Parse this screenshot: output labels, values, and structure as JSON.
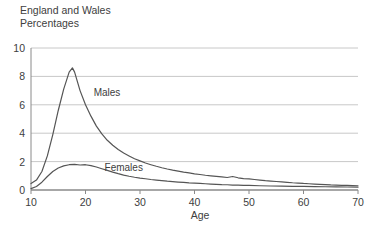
{
  "chart_data": {
    "type": "line",
    "title": "England and Wales",
    "subtitle": "Percentages",
    "xlabel": "Age",
    "ylabel": "",
    "xlim": [
      10,
      70
    ],
    "ylim": [
      0,
      10
    ],
    "xticks": [
      10,
      20,
      30,
      40,
      50,
      60,
      70
    ],
    "yticks": [
      0,
      2,
      4,
      6,
      8,
      10
    ],
    "grid": "horizontal",
    "legend_position": "inline-annotations",
    "annotations": [
      {
        "text": "Males",
        "x": 21.5,
        "y": 6.6
      },
      {
        "text": "Females",
        "x": 23.5,
        "y": 1.35
      }
    ],
    "series": [
      {
        "name": "Males",
        "color": "#555555",
        "x": [
          10,
          11,
          12,
          13,
          14,
          15,
          16,
          17,
          17.6,
          18,
          19,
          20,
          21,
          22,
          23,
          24,
          25,
          26,
          27,
          28,
          29,
          30,
          31,
          32,
          33,
          34,
          35,
          36,
          37,
          38,
          39,
          40,
          41,
          42,
          43,
          44,
          45,
          46,
          47,
          48,
          49,
          50,
          51,
          52,
          53,
          54,
          55,
          56,
          57,
          58,
          59,
          60,
          61,
          62,
          63,
          64,
          65,
          66,
          67,
          68,
          69,
          70
        ],
        "values": [
          0.45,
          0.7,
          1.3,
          2.4,
          3.9,
          5.6,
          7.1,
          8.3,
          8.6,
          8.3,
          7.0,
          6.0,
          5.2,
          4.5,
          3.95,
          3.5,
          3.15,
          2.85,
          2.6,
          2.4,
          2.2,
          2.05,
          1.9,
          1.78,
          1.67,
          1.57,
          1.48,
          1.4,
          1.33,
          1.26,
          1.2,
          1.14,
          1.09,
          1.04,
          1.0,
          0.96,
          0.92,
          0.88,
          0.95,
          0.86,
          0.8,
          0.78,
          0.74,
          0.7,
          0.66,
          0.63,
          0.6,
          0.57,
          0.54,
          0.51,
          0.49,
          0.46,
          0.44,
          0.42,
          0.4,
          0.38,
          0.36,
          0.35,
          0.33,
          0.32,
          0.31,
          0.3
        ]
      },
      {
        "name": "Females",
        "color": "#555555",
        "x": [
          10,
          11,
          12,
          13,
          14,
          15,
          16,
          17,
          18,
          19,
          20,
          21,
          22,
          23,
          24,
          25,
          26,
          27,
          28,
          29,
          30,
          31,
          32,
          33,
          34,
          35,
          36,
          37,
          38,
          39,
          40,
          41,
          42,
          43,
          44,
          45,
          46,
          47,
          48,
          49,
          50,
          52,
          54,
          56,
          58,
          60,
          62,
          64,
          66,
          68,
          70
        ],
        "values": [
          0.1,
          0.25,
          0.55,
          0.95,
          1.3,
          1.55,
          1.7,
          1.78,
          1.8,
          1.76,
          1.78,
          1.72,
          1.62,
          1.5,
          1.38,
          1.26,
          1.15,
          1.05,
          0.97,
          0.9,
          0.84,
          0.79,
          0.74,
          0.7,
          0.66,
          0.62,
          0.59,
          0.56,
          0.53,
          0.5,
          0.48,
          0.46,
          0.44,
          0.42,
          0.4,
          0.38,
          0.37,
          0.35,
          0.34,
          0.33,
          0.32,
          0.3,
          0.28,
          0.27,
          0.26,
          0.25,
          0.24,
          0.23,
          0.22,
          0.21,
          0.2
        ]
      }
    ],
    "colors": {
      "line": "#555555",
      "grid": "#c8c8c8",
      "axis": "#8a8a8a",
      "text": "#404040",
      "background": "#ffffff"
    }
  }
}
